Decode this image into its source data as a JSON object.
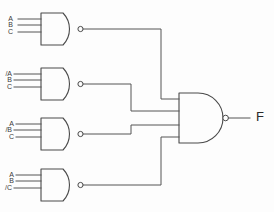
{
  "diagram": {
    "background_color": "#fdfdfd",
    "wire_color": "#555555",
    "gate_outline_color": "#4a4a4a"
  },
  "gates": [
    {
      "id": "nand1",
      "type": "NAND",
      "inputs": [
        "A",
        "B",
        "C"
      ],
      "input_count": 3
    },
    {
      "id": "nand2",
      "type": "NAND",
      "inputs": [
        "/A",
        "B",
        "C"
      ],
      "input_count": 3
    },
    {
      "id": "nand3",
      "type": "NAND",
      "inputs": [
        "A",
        "/B",
        "C"
      ],
      "input_count": 3
    },
    {
      "id": "nand4",
      "type": "NAND",
      "inputs": [
        "A",
        "B",
        "/C"
      ],
      "input_count": 3
    },
    {
      "id": "nand-out",
      "type": "NAND",
      "inputs": [],
      "input_count": 4
    }
  ],
  "output": {
    "label": "F"
  }
}
